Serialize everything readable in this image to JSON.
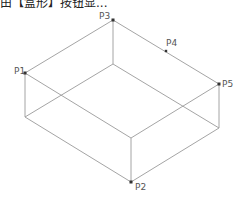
{
  "caption": "由【盒形】按钮显...",
  "diagram": {
    "type": "isometric-box",
    "line_color": "#9a9a9a",
    "point_color": "#333333",
    "points": [
      {
        "id": "P1",
        "label": "P1",
        "x": 25,
        "y": 73,
        "lx": 14,
        "ly": 71
      },
      {
        "id": "P2",
        "label": "P2",
        "x": 131,
        "y": 182,
        "lx": 135,
        "ly": 191
      },
      {
        "id": "P3",
        "label": "P3",
        "x": 113,
        "y": 20,
        "lx": 101,
        "ly": 18
      },
      {
        "id": "P4",
        "label": "P4",
        "x": 166,
        "y": 51,
        "lx": 167,
        "ly": 46
      },
      {
        "id": "P5",
        "label": "P5",
        "x": 219,
        "y": 84,
        "lx": 222,
        "ly": 88
      }
    ]
  }
}
